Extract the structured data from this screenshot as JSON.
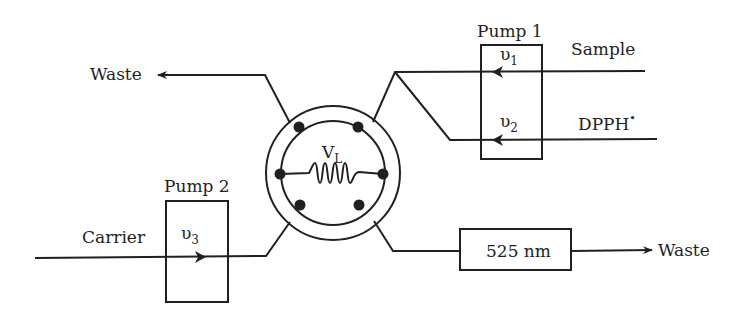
{
  "diagram": {
    "type": "flow-injection-analysis-schematic",
    "colors": {
      "stroke": "#231f20",
      "background": "#ffffff"
    },
    "labels": {
      "waste_top": "Waste",
      "waste_bottom": "Waste",
      "sample": "Sample",
      "dpph": "DPPH",
      "dpph_radical": "•",
      "carrier": "Carrier",
      "pump1": "Pump 1",
      "pump2": "Pump 2",
      "v1": "υ",
      "v1_sub": "1",
      "v2": "υ",
      "v2_sub": "2",
      "v3": "υ",
      "v3_sub": "3",
      "valve_volume": "V",
      "valve_volume_sub": "L",
      "detector": "525 nm"
    },
    "nodes": [
      {
        "id": "pump1",
        "label": "Pump 1",
        "channels": [
          "υ1",
          "υ2"
        ]
      },
      {
        "id": "pump2",
        "label": "Pump 2",
        "channels": [
          "υ3"
        ]
      },
      {
        "id": "valve",
        "label": "Injection valve with loop VL"
      },
      {
        "id": "detector",
        "label": "525 nm"
      }
    ],
    "edges": [
      {
        "from": "Sample",
        "to": "valve",
        "via": "Pump 1 (υ1)"
      },
      {
        "from": "DPPH•",
        "to": "valve",
        "via": "Pump 1 (υ2)"
      },
      {
        "from": "valve",
        "to": "Waste"
      },
      {
        "from": "Carrier",
        "to": "valve",
        "via": "Pump 2 (υ3)"
      },
      {
        "from": "valve",
        "to": "525 nm"
      },
      {
        "from": "525 nm",
        "to": "Waste"
      }
    ]
  }
}
